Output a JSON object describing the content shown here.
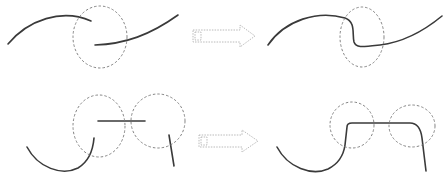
{
  "diagram": {
    "description": "Curve joining: disconnected stroke segments inside dashed circular regions are merged into smooth continuous curves",
    "colors": {
      "stroke": "#3a3a3a",
      "circle": "#777777",
      "arrow": "#a8a8a8",
      "background": "#ffffff"
    },
    "rows": [
      {
        "name": "row-1",
        "before": {
          "curves": 2,
          "dashed_circles": 1
        },
        "arrow": "right-arrow",
        "after": {
          "curves": 1,
          "dashed_circles": 1
        }
      },
      {
        "name": "row-2",
        "before": {
          "curves": 3,
          "dashed_circles": 2
        },
        "arrow": "right-arrow",
        "after": {
          "curves": 1,
          "dashed_circles": 2
        }
      }
    ]
  }
}
